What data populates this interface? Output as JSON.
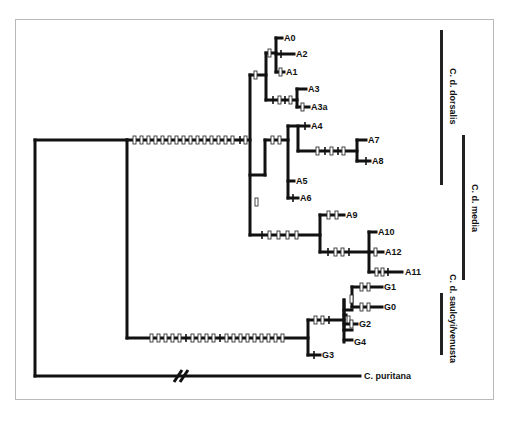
{
  "figure": {
    "type": "phylogenetic-tree",
    "outgroup": "C. puritana",
    "leaves": [
      {
        "id": "A0",
        "label": "A0"
      },
      {
        "id": "A2",
        "label": "A2"
      },
      {
        "id": "A1",
        "label": "A1"
      },
      {
        "id": "A3",
        "label": "A3"
      },
      {
        "id": "A3a",
        "label": "A3a"
      },
      {
        "id": "A4",
        "label": "A4"
      },
      {
        "id": "A7",
        "label": "A7"
      },
      {
        "id": "A8",
        "label": "A8"
      },
      {
        "id": "A5",
        "label": "A5"
      },
      {
        "id": "A6",
        "label": "A6"
      },
      {
        "id": "A9",
        "label": "A9"
      },
      {
        "id": "A10",
        "label": "A10"
      },
      {
        "id": "A12",
        "label": "A12"
      },
      {
        "id": "A11",
        "label": "A11"
      },
      {
        "id": "G1",
        "label": "G1"
      },
      {
        "id": "G0",
        "label": "G0"
      },
      {
        "id": "G2",
        "label": "G2"
      },
      {
        "id": "G4",
        "label": "G4"
      },
      {
        "id": "G3",
        "label": "G3"
      },
      {
        "id": "puritana",
        "label": "C. puritana"
      }
    ],
    "groups": [
      {
        "name": "C. d. dorsalis",
        "members": [
          "A0",
          "A2",
          "A1",
          "A3",
          "A3a"
        ]
      },
      {
        "name": "C. d. media",
        "members": [
          "A4",
          "A7",
          "A8",
          "A5",
          "A6",
          "A9",
          "A10",
          "A12",
          "A11"
        ]
      },
      {
        "name": "C. d. saulcyi/venusta",
        "members": [
          "G1",
          "G0",
          "G2",
          "G4"
        ]
      }
    ],
    "branch_break_symbol": "//",
    "legend": {
      "open_bar": "homoplasious change (open tick)",
      "solid_bar": "unique change (solid tick)"
    }
  }
}
